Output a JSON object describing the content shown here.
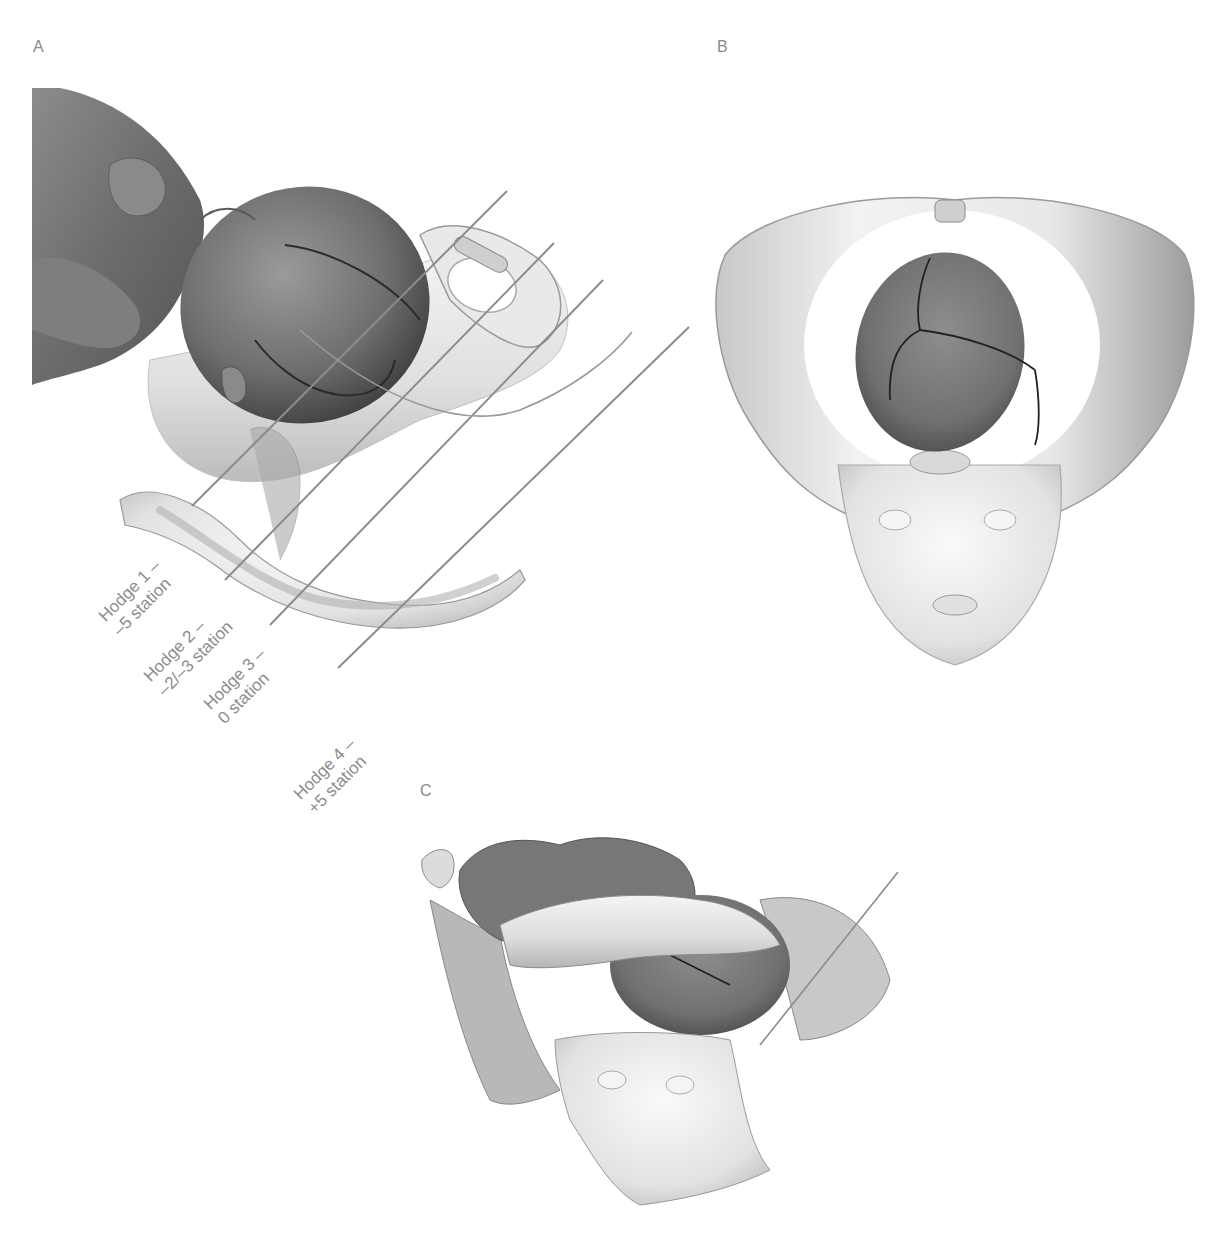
{
  "figure": {
    "panels": [
      {
        "id": "A",
        "label": "A",
        "description": "Lateral view of fetus head descending into pelvis with Hodge planes"
      },
      {
        "id": "B",
        "label": "B",
        "description": "Superior view of fetal head within pelvic inlet"
      },
      {
        "id": "C",
        "label": "C",
        "description": "Oblique view of fetus within pelvis"
      }
    ],
    "hodge_planes": [
      {
        "name": "Hodge 1 –",
        "station": "–5 station"
      },
      {
        "name": "Hodge 2 –",
        "station": "–2/–3 station"
      },
      {
        "name": "Hodge 3 –",
        "station": "0 station"
      },
      {
        "name": "Hodge 4 –",
        "station": "+5 station"
      }
    ],
    "colors": {
      "background": "#ffffff",
      "label_text": "#8a8a8a",
      "plane_line": "#8c8c8c",
      "bone": "#e6e6e6",
      "fetal_head": "#7a7a7a"
    }
  }
}
